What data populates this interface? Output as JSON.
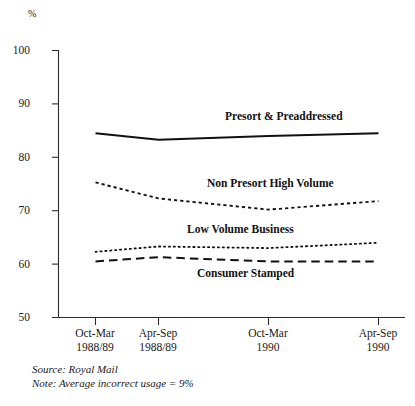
{
  "chart_data": {
    "type": "line",
    "title": "",
    "xlabel": "",
    "ylabel": "%",
    "ylim": [
      50,
      100
    ],
    "yticks": [
      100,
      90,
      80,
      70,
      60,
      50
    ],
    "grid": false,
    "legend_position": "inline-direct-labels",
    "categories": [
      "Oct-Mar 1988/89",
      "Apr-Sep 1988/89",
      "Oct-Mar 1990",
      "Apr-Sep 1990"
    ],
    "category_lines": [
      {
        "l1": "Oct-Mar",
        "l2": "1988/89"
      },
      {
        "l1": "Apr-Sep",
        "l2": "1988/89"
      },
      {
        "l1": "Oct-Mar",
        "l2": "1990"
      },
      {
        "l1": "Apr-Sep",
        "l2": "1990"
      }
    ],
    "series": [
      {
        "name": "Presort & Preaddressed",
        "style": "solid",
        "values": [
          84.5,
          83.3,
          84.0,
          84.5
        ]
      },
      {
        "name": "Non Presort High Volume",
        "style": "dashed",
        "values": [
          75.3,
          72.3,
          70.2,
          71.8
        ]
      },
      {
        "name": "Low Volume Business",
        "style": "dotted",
        "values": [
          62.3,
          63.3,
          63.0,
          64.0
        ]
      },
      {
        "name": "Consumer Stamped",
        "style": "long-dashed",
        "values": [
          60.5,
          61.3,
          60.5,
          60.5
        ]
      }
    ],
    "annotations": [
      "Source: Royal Mail",
      "Note: Average incorrect usage = 9%"
    ]
  },
  "axis": {
    "unit_label": "%",
    "ytick_labels": [
      "100",
      "90",
      "80",
      "70",
      "60",
      "50"
    ]
  },
  "series_labels": {
    "presort_preaddressed": "Presort & Preaddressed",
    "non_presort_high_volume": "Non Presort High Volume",
    "low_volume_business": "Low Volume Business",
    "consumer_stamped": "Consumer Stamped"
  },
  "xaxis": {
    "t0_line1": "Oct-Mar",
    "t0_line2": "1988/89",
    "t1_line1": "Apr-Sep",
    "t1_line2": "1988/89",
    "t2_line1": "Oct-Mar",
    "t2_line2": "1990",
    "t3_line1": "Apr-Sep",
    "t3_line2": "1990"
  },
  "footnotes": {
    "source": "Source: Royal Mail",
    "note": "Note: Average incorrect usage = 9%"
  },
  "colors": {
    "ink": "#111111",
    "axis": "#2b2b2b",
    "background": "#ffffff"
  }
}
